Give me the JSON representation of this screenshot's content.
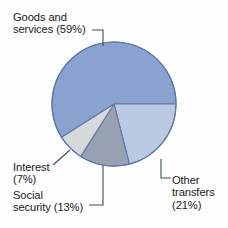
{
  "chart_data": {
    "type": "pie",
    "title": "",
    "categories": [
      "Goods and services",
      "Other transfers",
      "Social security",
      "Interest"
    ],
    "values": [
      59,
      21,
      13,
      7
    ],
    "unit": "percent",
    "legend_position": "callout-labels",
    "grid": false,
    "colors": {
      "goods_and_services": "#8aa2d0",
      "other_transfers": "#bcc9e3",
      "social_security": "#97a1b3",
      "interest": "#d6d8da",
      "outline": "#5f78a8",
      "leader_line": "#3d4a66",
      "text": "#1b1b1b",
      "background": "#fdfdfd"
    },
    "slices": [
      {
        "key": "goods_and_services",
        "label": "Goods and services",
        "percent": 59,
        "start_deg": 147.6,
        "end_deg": 360.0,
        "color": "#8aa2d0"
      },
      {
        "key": "other_transfers",
        "label": "Other transfers",
        "percent": 21,
        "start_deg": 0.0,
        "end_deg": 75.6,
        "color": "#bcc9e3"
      },
      {
        "key": "social_security",
        "label": "Social security",
        "percent": 13,
        "start_deg": 75.6,
        "end_deg": 122.4,
        "color": "#97a1b3"
      },
      {
        "key": "interest",
        "label": "Interest",
        "percent": 7,
        "start_deg": 122.4,
        "end_deg": 147.6,
        "color": "#d6d8da"
      }
    ]
  },
  "labels": {
    "goods": {
      "line1": "Goods and",
      "line2": "services (59%)"
    },
    "interest": {
      "line1": "Interest",
      "line2": "(7%)"
    },
    "social": {
      "line1": "Social",
      "line2": "security (13%)"
    },
    "other": {
      "line1": "Other",
      "line2": "transfers",
      "line3": "(21%)"
    }
  }
}
